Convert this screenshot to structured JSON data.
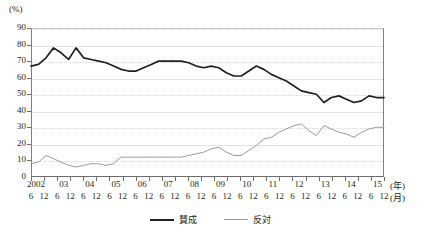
{
  "unit_label": "(%)",
  "axis": {
    "y_unit": "(%)",
    "x_year_unit": "(年)",
    "x_month_unit": "(月)",
    "y_ticks": [
      "0",
      "10",
      "20",
      "30",
      "40",
      "50",
      "60",
      "70",
      "80",
      "90"
    ],
    "year_labels": [
      "2002",
      "03",
      "04",
      "05",
      "06",
      "07",
      "08",
      "09",
      "10",
      "11",
      "12",
      "13",
      "14",
      "15"
    ],
    "month_labels": [
      "6",
      "12",
      "6",
      "12",
      "6",
      "12",
      "6",
      "12",
      "6",
      "12",
      "6",
      "12",
      "6",
      "12",
      "6",
      "12",
      "6",
      "12",
      "6",
      "12",
      "6",
      "12",
      "6",
      "12",
      "6",
      "12",
      "6",
      "12"
    ]
  },
  "legend": {
    "items": [
      {
        "label": "賛成",
        "color": "#231f20",
        "style": "thick-solid"
      },
      {
        "label": "反対",
        "color": "#9a9a9a",
        "style": "thin-solid"
      }
    ]
  },
  "colors": {
    "approve_line": "#231f20",
    "oppose_line": "#9a9a9a",
    "grid": "#e3e3e3",
    "axis": "#6d6d6d",
    "background": "#ffffff"
  },
  "chart_data": {
    "type": "line",
    "title": "",
    "subtitle": "",
    "xlabel": "(年) / (月)",
    "ylabel": "(%)",
    "ylim": [
      0,
      90
    ],
    "ytick_step": 10,
    "grid": true,
    "legend_position": "bottom-center",
    "x": [
      "2002-6",
      "2002-12",
      "2003-6",
      "2003-12",
      "2004-6",
      "2004-12",
      "2005-6",
      "2005-12",
      "2006-6",
      "2006-12",
      "2007-6",
      "2007-12",
      "2008-6",
      "2008-12",
      "2009-6",
      "2009-12",
      "2010-6",
      "2010-12",
      "2011-6",
      "2011-12",
      "2012-6",
      "2012-12",
      "2013-6",
      "2013-12",
      "2014-6",
      "2014-12",
      "2015-6",
      "2015-12"
    ],
    "series": [
      {
        "name": "賛成",
        "color": "#231f20",
        "values": [
          67,
          68,
          72,
          78,
          75,
          71,
          78,
          72,
          71,
          69,
          67,
          65,
          64,
          66,
          68,
          70,
          70,
          70,
          69,
          67,
          68,
          67,
          65,
          63,
          61,
          61,
          61,
          61
        ]
      },
      {
        "name": "反対",
        "color": "#9a9a9a",
        "values": [
          8,
          9,
          13,
          11,
          10,
          7,
          7,
          8,
          9,
          8,
          7,
          12,
          12,
          12,
          12,
          12,
          12,
          12,
          13,
          14,
          15,
          17,
          18,
          15,
          13,
          13,
          14,
          16
        ]
      }
    ]
  },
  "plot_points": {
    "approve": [
      [
        0,
        67
      ],
      [
        1,
        68
      ],
      [
        2,
        72
      ],
      [
        3,
        78
      ],
      [
        4,
        75
      ],
      [
        5,
        71
      ],
      [
        6,
        78
      ],
      [
        7,
        72
      ],
      [
        8,
        71
      ],
      [
        9,
        70
      ],
      [
        10,
        69
      ],
      [
        11,
        67
      ],
      [
        12,
        65
      ],
      [
        13,
        64
      ],
      [
        14,
        64
      ],
      [
        15,
        66
      ],
      [
        16,
        68
      ],
      [
        17,
        70
      ],
      [
        18,
        70
      ],
      [
        19,
        70
      ],
      [
        20,
        70
      ],
      [
        21,
        69
      ],
      [
        22,
        67
      ],
      [
        23,
        66
      ],
      [
        24,
        67
      ],
      [
        25,
        66
      ],
      [
        26,
        63
      ],
      [
        27,
        61
      ],
      [
        28,
        61
      ],
      [
        29,
        64
      ],
      [
        30,
        67
      ],
      [
        31,
        65
      ],
      [
        32,
        62
      ],
      [
        33,
        60
      ],
      [
        34,
        58
      ],
      [
        35,
        55
      ],
      [
        36,
        52
      ],
      [
        37,
        51
      ],
      [
        38,
        50
      ],
      [
        39,
        45
      ],
      [
        40,
        48
      ],
      [
        41,
        49
      ],
      [
        42,
        47
      ],
      [
        43,
        45
      ],
      [
        44,
        46
      ],
      [
        45,
        49
      ],
      [
        46,
        48
      ],
      [
        47,
        48
      ]
    ],
    "oppose": [
      [
        0,
        8
      ],
      [
        1,
        9
      ],
      [
        2,
        13
      ],
      [
        3,
        11
      ],
      [
        4,
        9
      ],
      [
        5,
        7
      ],
      [
        6,
        6
      ],
      [
        7,
        7
      ],
      [
        8,
        8
      ],
      [
        9,
        8
      ],
      [
        10,
        7
      ],
      [
        11,
        8
      ],
      [
        12,
        12
      ],
      [
        13,
        12
      ],
      [
        14,
        12
      ],
      [
        15,
        12
      ],
      [
        16,
        12
      ],
      [
        17,
        12
      ],
      [
        18,
        12
      ],
      [
        19,
        12
      ],
      [
        20,
        12
      ],
      [
        21,
        13
      ],
      [
        22,
        14
      ],
      [
        23,
        15
      ],
      [
        24,
        17
      ],
      [
        25,
        18
      ],
      [
        26,
        15
      ],
      [
        27,
        13
      ],
      [
        28,
        13
      ],
      [
        29,
        16
      ],
      [
        30,
        19
      ],
      [
        31,
        23
      ],
      [
        32,
        24
      ],
      [
        33,
        27
      ],
      [
        34,
        29
      ],
      [
        35,
        31
      ],
      [
        36,
        32
      ],
      [
        37,
        28
      ],
      [
        38,
        25
      ],
      [
        39,
        31
      ],
      [
        40,
        29
      ],
      [
        41,
        27
      ],
      [
        42,
        26
      ],
      [
        43,
        24
      ],
      [
        44,
        27
      ],
      [
        45,
        29
      ],
      [
        46,
        30
      ],
      [
        47,
        30
      ]
    ]
  }
}
